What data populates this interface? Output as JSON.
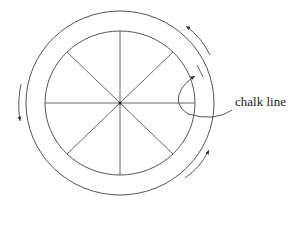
{
  "diagram": {
    "label": "chalk line",
    "stroke_color": "#444444",
    "outer_circle": {
      "cx": 120,
      "cy": 103,
      "rx": 94,
      "ry": 92
    },
    "inner_circle": {
      "cx": 120,
      "cy": 103,
      "rx": 75,
      "ry": 72
    },
    "spokes": 8,
    "arrows": [
      {
        "position": "top-right",
        "direction": "counterclockwise-up"
      },
      {
        "position": "bottom-right",
        "direction": "counterclockwise-up"
      },
      {
        "position": "left",
        "direction": "down"
      },
      {
        "position": "chalk-line-pointer",
        "direction": "up-right"
      }
    ]
  }
}
